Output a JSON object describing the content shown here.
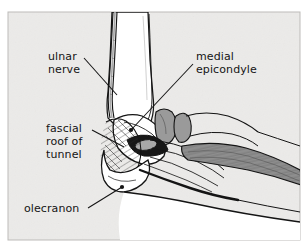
{
  "figure": {
    "panel": {
      "background_color": "#ecebe9",
      "border_color": "#b8b6b4",
      "x": 8,
      "y": 12,
      "width": 292,
      "height": 228
    },
    "colors": {
      "ink": "#141414",
      "bone_fill": "#ffffff",
      "cartilage_gray": "#9a9a9a",
      "muscle_gray": "#8e8e8e",
      "nerve_gray": "#a8a8a8",
      "tunnel_dark": "#171717",
      "page_white": "#ffffff"
    },
    "labels": [
      {
        "id": "ulnar-nerve",
        "lines": [
          "ulnar",
          "nerve"
        ],
        "text_x": 48,
        "text_y": 60,
        "anchor": "start",
        "leader": {
          "x1": 84,
          "y1": 58,
          "x2": 117,
          "y2": 95
        },
        "marker": "none"
      },
      {
        "id": "medial-epicondyle",
        "lines": [
          "medial",
          "epicondyle"
        ],
        "text_x": 196,
        "text_y": 60,
        "anchor": "start",
        "leader": {
          "x1": 193,
          "y1": 64,
          "x2": 131,
          "y2": 130
        },
        "marker": "dot"
      },
      {
        "id": "fascial-roof-of-tunnel",
        "lines": [
          "fascial",
          "roof of",
          "tunnel"
        ],
        "text_x": 46,
        "text_y": 132,
        "anchor": "start",
        "leader": {
          "x1": 92,
          "y1": 130,
          "x2": 124,
          "y2": 147
        },
        "marker": "none"
      },
      {
        "id": "olecranon",
        "lines": [
          "olecranon"
        ],
        "text_x": 24,
        "text_y": 212,
        "anchor": "start",
        "leader": {
          "x1": 88,
          "y1": 208,
          "x2": 122,
          "y2": 187
        },
        "marker": "dot"
      }
    ],
    "structures": [
      {
        "id": "humerus-shaft",
        "name": "humerus shaft",
        "kind": "bone"
      },
      {
        "id": "ulnar-nerve-proximal",
        "name": "ulnar nerve proximal segment",
        "kind": "nerve"
      },
      {
        "id": "medial-epicondyle-bone",
        "name": "medial epicondyle",
        "kind": "bone"
      },
      {
        "id": "trochlea-condyle",
        "name": "trochlea and condyle",
        "kind": "cartilage"
      },
      {
        "id": "olecranon-bone",
        "name": "olecranon of ulna",
        "kind": "bone"
      },
      {
        "id": "cubital-tunnel-opening",
        "name": "cubital tunnel opening",
        "kind": "aperture"
      },
      {
        "id": "fascial-roof",
        "name": "fascial roof of cubital tunnel",
        "kind": "fascia"
      },
      {
        "id": "flexor-carpi-ulnaris",
        "name": "flexor carpi ulnaris muscle belly",
        "kind": "muscle"
      },
      {
        "id": "forearm-ulna",
        "name": "ulna and forearm contour",
        "kind": "bone"
      }
    ]
  }
}
